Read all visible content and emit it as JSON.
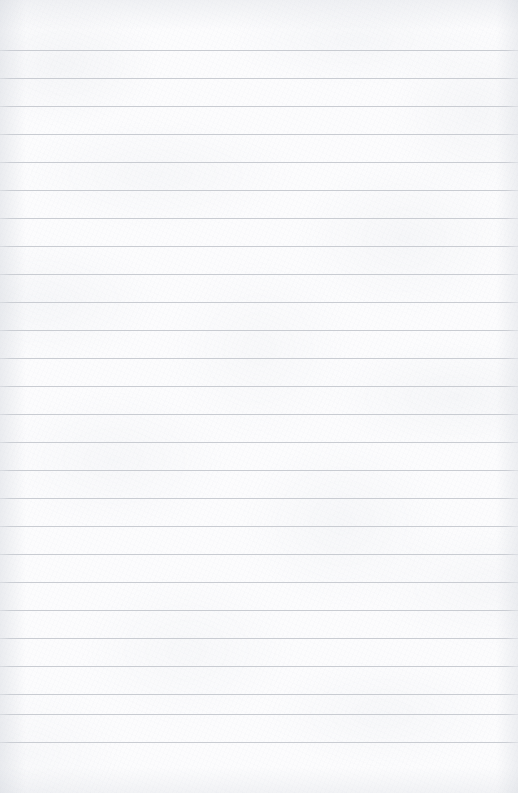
{
  "document": {
    "type": "lined-paper",
    "title": "Blank ruled notebook page",
    "page_width": 518,
    "page_height": 793,
    "content_text": "",
    "has_text": false,
    "has_margin_rule": false,
    "has_punch_holes": false,
    "has_header": false,
    "has_page_number": false
  },
  "paper": {
    "background_color": "#fcfcfd",
    "texture_tint": "#cdd2da",
    "vignette_color": "#d0d4db"
  },
  "ruling": {
    "line_color": "#c9ccd2",
    "line_thickness_px": 1,
    "line_spacing_px": 28,
    "first_line_y": 50,
    "last_line_y": 742,
    "line_count": 26,
    "top_margin_px": 50,
    "bottom_margin_px": 51,
    "full_bleed": true,
    "line_positions": [
      50,
      78,
      106,
      134,
      162,
      190,
      218,
      246,
      274,
      302,
      330,
      358,
      386,
      414,
      442,
      470,
      498,
      526,
      554,
      582,
      610,
      638,
      666,
      694,
      714,
      742
    ]
  }
}
